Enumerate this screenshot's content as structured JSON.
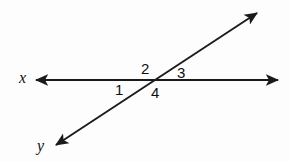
{
  "figure": {
    "background_color": "#fdfdfd",
    "stroke_color": "#1a1a1a",
    "stroke_width": 2
  },
  "lines": [
    {
      "name": "line-x",
      "description": "horizontal line labelled x, double-headed arrow",
      "x1": 36,
      "y1": 80,
      "x2": 278,
      "y2": 80,
      "arrow_start": true,
      "arrow_end": true
    },
    {
      "name": "line-y",
      "description": "diagonal line labelled y, double-headed arrow rising to the upper right",
      "x1": 56,
      "y1": 145,
      "x2": 257,
      "y2": 13,
      "arrow_start": true,
      "arrow_end": true
    }
  ],
  "intersection": {
    "x": 152,
    "y": 80
  },
  "axis_labels": [
    {
      "id": "x",
      "text": "x"
    },
    {
      "id": "y",
      "text": "y"
    }
  ],
  "angle_labels": [
    {
      "id": "1",
      "text": "1",
      "position": "lower-left"
    },
    {
      "id": "2",
      "text": "2",
      "position": "upper-left"
    },
    {
      "id": "3",
      "text": "3",
      "position": "upper-right"
    },
    {
      "id": "4",
      "text": "4",
      "position": "lower-right"
    }
  ]
}
